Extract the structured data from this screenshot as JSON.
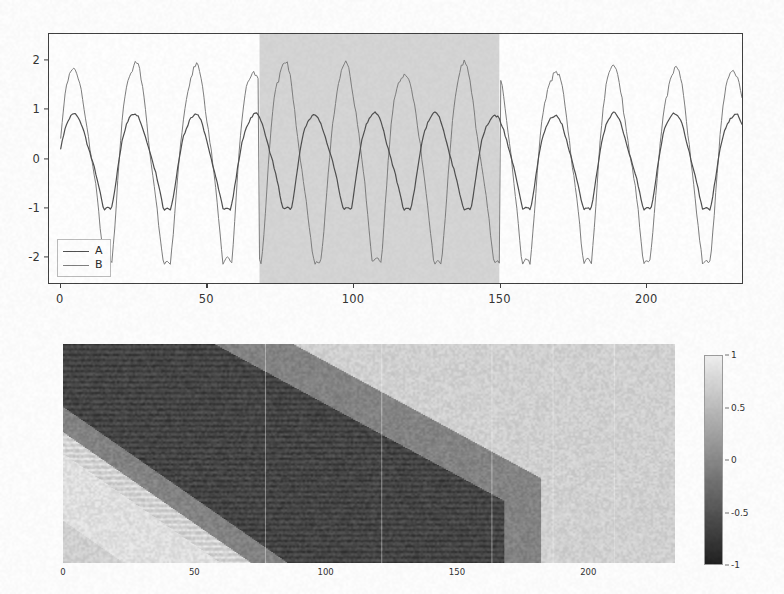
{
  "figure": {
    "background_color": "#fefefe",
    "panels": [
      "timeseries",
      "correlation-heatmap"
    ]
  },
  "chart_data": [
    {
      "type": "line",
      "id": "timeseries",
      "title": "",
      "xlabel": "",
      "ylabel": "",
      "xlim": [
        -4,
        233
      ],
      "ylim": [
        -2.55,
        2.55
      ],
      "xticks": [
        0,
        50,
        100,
        150,
        200
      ],
      "xticklabels": [
        "0",
        "50",
        "100",
        "150",
        "200"
      ],
      "yticks": [
        2,
        1,
        0,
        -1,
        -2
      ],
      "yticklabels": [
        "2",
        "1",
        "0",
        "-1",
        "-2"
      ],
      "grid": false,
      "legend_position": "lower left",
      "legend_entries": [
        "A",
        "B"
      ],
      "shaded_span": {
        "x_start": 68,
        "x_end": 150,
        "color": "#d4d4d4",
        "label": "anti-phase interval"
      },
      "series": [
        {
          "name": "A",
          "color": "#4a4a4a",
          "linewidth": 1.2,
          "amplitude": 1.0,
          "period": 20.5,
          "phase_flip_in_span": false,
          "description": "lower amplitude signal, stays in phase throughout",
          "values": [
            0.18,
            0.52,
            0.81,
            0.96,
            1.03,
            1.01,
            0.88,
            0.77,
            0.62,
            0.31,
            0.02,
            -0.3,
            -0.55,
            -0.71,
            -0.69,
            -0.78,
            -0.86,
            -0.92,
            -0.8,
            -0.55,
            -0.5,
            -0.21,
            0.18,
            0.52,
            0.78,
            0.88,
            0.85,
            0.92,
            0.83,
            0.62,
            0.31,
            0.02,
            -0.3,
            -0.58,
            -0.74,
            -0.68,
            -0.8,
            -0.95,
            -0.88,
            -0.76,
            -0.48,
            -0.15,
            0.24,
            0.58,
            0.84,
            0.95,
            0.9,
            0.96,
            0.86,
            0.64,
            0.33,
            0.0,
            -0.33,
            -0.6,
            -0.76,
            -0.7,
            -0.82,
            -0.93,
            -0.86,
            -0.72,
            -0.45,
            -0.12,
            0.28,
            0.63,
            0.88,
            1.0,
            0.93,
            0.99,
            0.88,
            0.66
          ]
        },
        {
          "name": "B",
          "color": "#7a7a7a",
          "linewidth": 1.0,
          "amplitude": 2.05,
          "period": 20.5,
          "phase_flip_in_span": true,
          "description": "higher amplitude signal; phase-inverted inside the shaded span",
          "values": [
            0.85,
            1.4,
            1.85,
            2.08,
            2.02,
            1.85,
            1.6,
            1.2,
            0.65,
            0.05,
            -0.6,
            -1.15,
            -1.6,
            -1.95,
            -2.12,
            -2.05,
            -1.8,
            -1.4,
            -0.95,
            -0.45,
            0.1,
            0.75,
            1.35,
            1.8,
            2.0,
            1.92,
            2.02,
            1.7,
            1.25,
            0.7,
            0.08,
            -0.55,
            -1.1,
            -1.6,
            -1.98,
            -2.1,
            -2.0,
            -1.72,
            -1.3,
            -0.82,
            -0.3,
            0.32,
            0.95,
            1.5,
            1.9,
            2.08,
            1.95,
            1.75,
            1.35,
            0.8
          ]
        }
      ]
    },
    {
      "type": "heatmap",
      "id": "correlation-heatmap",
      "title": "",
      "xlabel": "",
      "ylabel": "",
      "xticks": [
        0,
        50,
        100,
        150,
        200
      ],
      "xticklabels": [
        "0",
        "50",
        "100",
        "150",
        "200"
      ],
      "colormap": "gray",
      "value_range": [
        -1,
        1
      ],
      "description": "windowed cross-correlation map; a broad dark (negative) diagonal band runs from upper-left to lower-right, flanked below by a light (positive) band; dark band terminates near x = 160",
      "features": {
        "dark_band": {
          "value": -0.95,
          "start_top_left": [
            0,
            0.0
          ],
          "end": [
            160,
            1.0
          ],
          "note": "strong negative correlation ridge"
        },
        "light_band": {
          "value": 0.95,
          "note": "positive band immediately below the dark diagonal"
        },
        "background_value": 0.78
      },
      "colorbar": {
        "ticks": [
          1,
          0.5,
          0,
          -0.5,
          -1
        ],
        "ticklabels": [
          "1",
          "0.5",
          "0",
          "-0.5",
          "-1"
        ],
        "orientation": "vertical",
        "position": "right",
        "top_value": "1",
        "bottom_value": "-1"
      }
    }
  ],
  "timeseries": {
    "legend": {
      "entries": [
        {
          "label": "A",
          "color": "#4a4a4a"
        },
        {
          "label": "B",
          "color": "#7a7a7a"
        }
      ]
    },
    "yticklabels": [
      "2",
      "1",
      "0",
      "-1",
      "-2"
    ],
    "xticklabels": [
      "0",
      "50",
      "100",
      "150",
      "200"
    ]
  },
  "heatmap": {
    "xticklabels": [
      "0",
      "50",
      "100",
      "150",
      "200"
    ],
    "colorbar_ticklabels": [
      "1",
      "0.5",
      "0",
      "-0.5",
      "-1"
    ]
  }
}
